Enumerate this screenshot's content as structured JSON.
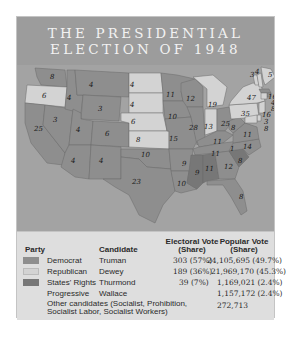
{
  "title": {
    "line1": "THE PRESIDENTIAL",
    "line2": "ELECTION OF 1948"
  },
  "colors": {
    "democrat": "#8e8e8e",
    "republican": "#d3d3d3",
    "states_rights": "#777777",
    "ocean": "#a3a3a3",
    "title_band": "#9c9c9c",
    "table_bg": "#dedede"
  },
  "table": {
    "headers": {
      "party": "Party",
      "candidate": "Candidate",
      "electoral_line1": "Electoral Vote",
      "electoral_line2": "(Share)",
      "popular_line1": "Popular Vote",
      "popular_line2": "(Share)"
    },
    "rows": [
      {
        "party": "Democrat",
        "candidate": "Truman",
        "electoral": "303 (57%)",
        "popular": "24,105,695 (49.7%)"
      },
      {
        "party": "Republican",
        "candidate": "Dewey",
        "electoral": "189 (36%)",
        "popular": "21,969,170 (45.3%)"
      },
      {
        "party": "States' Rights",
        "candidate": "Thurmond",
        "electoral": "39 (7%)",
        "popular": "1,169,021 (2.4%)"
      },
      {
        "party": "Progressive",
        "candidate": "Wallace",
        "electoral": "",
        "popular": "1,157,172 (2.4%)"
      }
    ],
    "other": {
      "label_line1": "Other candidates (Socialist, Prohibition,",
      "label_line2": "Socialist Labor, Socialist Workers)",
      "popular": "272,713"
    }
  },
  "map_labels": {
    "wa": "8",
    "or": "6",
    "ca": "25",
    "id": "4",
    "nv": "3",
    "mt": "4",
    "wy": "3",
    "ut": "4",
    "co": "6",
    "az": "4",
    "nm": "4",
    "nd": "4",
    "sd": "4",
    "ne": "6",
    "ks": "8",
    "ok": "10",
    "tx": "23",
    "mn": "11",
    "ia": "10",
    "mo": "15",
    "ar": "9",
    "la": "10",
    "wi": "12",
    "il": "28",
    "mi": "19",
    "in": "13",
    "oh": "25",
    "ky": "11",
    "tn": "11",
    "ms": "9",
    "al": "11",
    "ga": "12",
    "fl": "8",
    "sc": "8",
    "nc": "14",
    "va": "11",
    "wv": "8",
    "pa": "35",
    "ny": "47",
    "vt": "3",
    "nh": "4",
    "me": "5",
    "ma": "16",
    "ri": "4",
    "ct": "8",
    "nj": "16",
    "de": "3",
    "md": "8",
    "tn_split": "1"
  }
}
